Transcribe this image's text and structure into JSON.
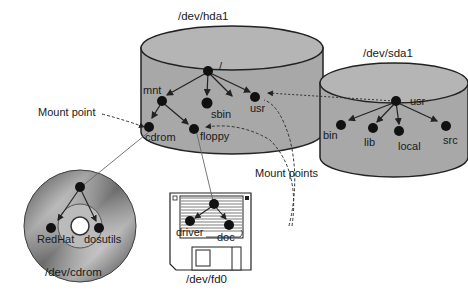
{
  "devices": {
    "hda1": {
      "label": "/dev/hda1",
      "nodes": {
        "root": "/",
        "mnt": "mnt",
        "sbin": "sbin",
        "usr": "usr",
        "cdrom": "cdrom",
        "floppy": "floppy"
      }
    },
    "sda1": {
      "label": "/dev/sda1",
      "nodes": {
        "usr": "usr",
        "bin": "bin",
        "lib": "lib",
        "local": "local",
        "src": "src"
      }
    },
    "cdrom": {
      "label": "/dev/cdrom",
      "nodes": {
        "redhat": "RedHat",
        "dosutils": "dosutils"
      }
    },
    "fd0": {
      "label": "/dev/fd0",
      "nodes": {
        "driver": "driver",
        "doc": "doc"
      }
    }
  },
  "annotations": {
    "mount_point": "Mount point",
    "mount_points": "Mount points"
  },
  "colors": {
    "cylinder_fill": "#a8a8a8",
    "cylinder_top": "#b8b8b8",
    "node": "#111111",
    "line": "#222222"
  }
}
